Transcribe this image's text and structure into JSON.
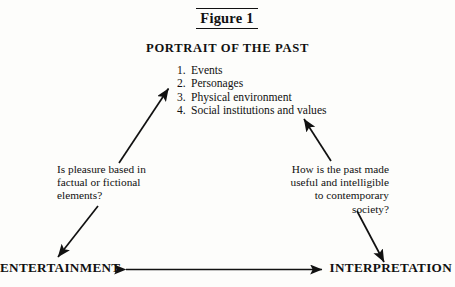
{
  "figure": {
    "caption": "Figure 1",
    "title": "PORTRAIT OF THE PAST",
    "items": [
      {
        "num": "1.",
        "label": "Events"
      },
      {
        "num": "2.",
        "label": "Personages"
      },
      {
        "num": "3.",
        "label": "Physical environment"
      },
      {
        "num": "4.",
        "label": "Social institutions and values"
      }
    ],
    "left_question": {
      "line1": "Is pleasure based in",
      "line2": "factual or fictional",
      "line3": "elements?"
    },
    "right_question": {
      "line1": "How is the past made",
      "line2": "useful and intelligible",
      "line3": "to contemporary",
      "line4": "society?"
    },
    "corners": {
      "left": "ENTERTAINMENT",
      "right": "INTERPRETATION"
    },
    "colors": {
      "ink": "#111111",
      "paper": "#fdfdfb"
    }
  }
}
